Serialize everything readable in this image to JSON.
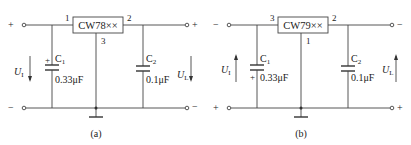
{
  "figures": [
    {
      "id": "a",
      "caption": "(a)",
      "chip_label": "CW78××",
      "pins": {
        "input": "1",
        "output": "2",
        "ground": "3"
      },
      "input_top_sign": "+",
      "input_bottom_sign": "−",
      "output_top_sign": "+",
      "output_bottom_sign": "−",
      "input_voltage": {
        "symbol": "U",
        "sub": "I",
        "direction": "down"
      },
      "output_voltage": {
        "symbol": "U",
        "sub": "L",
        "direction": "down"
      },
      "c1": {
        "name": "C",
        "sub": "1",
        "value": "0.33μF",
        "polarity_mark": "+",
        "polarity_position": "top"
      },
      "c2": {
        "name": "C",
        "sub": "2",
        "value": "0.1μF"
      }
    },
    {
      "id": "b",
      "caption": "(b)",
      "chip_label": "CW79××",
      "pins": {
        "input": "3",
        "output": "2",
        "ground": "1"
      },
      "input_top_sign": "−",
      "input_bottom_sign": "+",
      "output_top_sign": "−",
      "output_bottom_sign": "+",
      "input_voltage": {
        "symbol": "U",
        "sub": "I",
        "direction": "up"
      },
      "output_voltage": {
        "symbol": "U",
        "sub": "L",
        "direction": "up"
      },
      "c1": {
        "name": "C",
        "sub": "1",
        "value": "0.33μF",
        "polarity_mark": "+",
        "polarity_position": "bottom"
      },
      "c2": {
        "name": "C",
        "sub": "2",
        "value": "0.1μF"
      }
    }
  ]
}
